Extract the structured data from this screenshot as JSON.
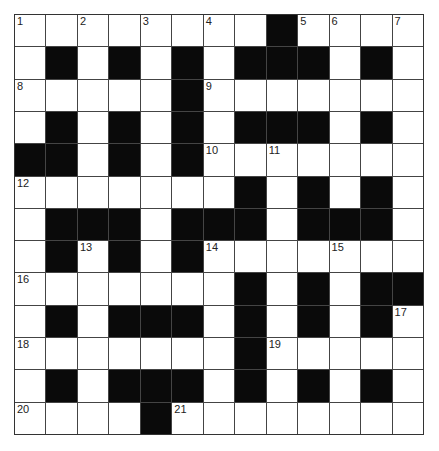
{
  "puzzle": {
    "rows": 13,
    "cols": 13,
    "grid": [
      "WWWWWWWWBWWWW",
      "WBWBWBWBBBWBW",
      "WWWWWBWWWWWWW",
      "WBWBWBWBBBWBW",
      "BBWBWBWWWWWWW",
      "WWWWWWWBWBWBW",
      "WBBBWBBBWBBBW",
      "WBWBWBWWWWWWW",
      "WWWWWWWBWBWBB",
      "WBWBBBWBWBWBW",
      "WWWWWWWBWWWWW",
      "WBWBBBWBWBWBW",
      "WWWWBWWWWWWWW"
    ],
    "numbers": [
      {
        "r": 0,
        "c": 0,
        "n": "1"
      },
      {
        "r": 0,
        "c": 2,
        "n": "2"
      },
      {
        "r": 0,
        "c": 4,
        "n": "3"
      },
      {
        "r": 0,
        "c": 6,
        "n": "4"
      },
      {
        "r": 0,
        "c": 9,
        "n": "5"
      },
      {
        "r": 0,
        "c": 10,
        "n": "6"
      },
      {
        "r": 0,
        "c": 12,
        "n": "7"
      },
      {
        "r": 2,
        "c": 0,
        "n": "8"
      },
      {
        "r": 2,
        "c": 6,
        "n": "9"
      },
      {
        "r": 4,
        "c": 6,
        "n": "10"
      },
      {
        "r": 4,
        "c": 8,
        "n": "11"
      },
      {
        "r": 5,
        "c": 0,
        "n": "12"
      },
      {
        "r": 7,
        "c": 2,
        "n": "13"
      },
      {
        "r": 7,
        "c": 6,
        "n": "14"
      },
      {
        "r": 7,
        "c": 10,
        "n": "15"
      },
      {
        "r": 8,
        "c": 0,
        "n": "16"
      },
      {
        "r": 9,
        "c": 12,
        "n": "17"
      },
      {
        "r": 10,
        "c": 0,
        "n": "18"
      },
      {
        "r": 10,
        "c": 8,
        "n": "19"
      },
      {
        "r": 12,
        "c": 0,
        "n": "20"
      },
      {
        "r": 12,
        "c": 5,
        "n": "21"
      }
    ]
  }
}
